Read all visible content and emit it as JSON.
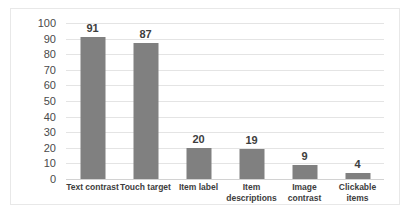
{
  "chart_data": {
    "type": "bar",
    "title": "",
    "subtitle": "",
    "xlabel": "",
    "ylabel": "",
    "categories": [
      "Text contrast",
      "Touch target",
      "Item label",
      "Item\ndescriptions",
      "Image\ncontrast",
      "Clickable\nitems"
    ],
    "values": [
      91,
      87,
      20,
      19,
      9,
      4
    ],
    "data_labels": [
      "91",
      "87",
      "20",
      "19",
      "9",
      "4"
    ],
    "ylim": [
      0,
      100
    ],
    "ytick_step": 10,
    "ytick_labels": [
      "100",
      "90",
      "80",
      "70",
      "60",
      "50",
      "40",
      "30",
      "20",
      "10",
      "0"
    ],
    "grid": true,
    "grid_axis": "y",
    "legend": false,
    "legend_position": "none",
    "series": [
      {
        "name": "",
        "values": [
          91,
          87,
          20,
          19,
          9,
          4
        ]
      }
    ]
  },
  "style": {
    "bar_color": "#808080",
    "grid_color": "#e4e4e4",
    "axis_color": "#d2d2d2",
    "label_color": "#3d3d3d",
    "tick_color": "#4a4a4a",
    "frame_border_color": "#e8e8e8",
    "background": "#ffffff"
  }
}
